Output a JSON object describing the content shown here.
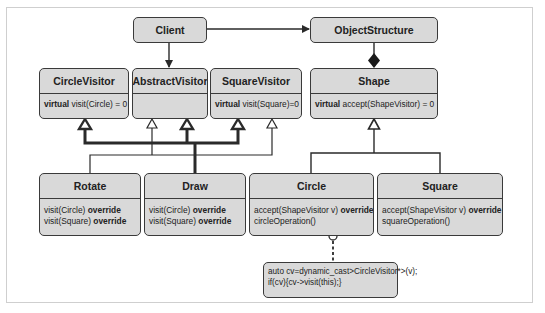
{
  "diagram": {
    "classes": {
      "client": {
        "name": "Client"
      },
      "object_structure": {
        "name": "ObjectStructure"
      },
      "circle_visitor": {
        "name": "CircleVisitor",
        "method_kw": "virtual",
        "method": " visit(Circle) = 0"
      },
      "abstract_visitor": {
        "name": "AbstractVisitor"
      },
      "square_visitor": {
        "name": "SquareVisitor",
        "method_kw": "virtual",
        "method": " visit(Square)=0"
      },
      "shape": {
        "name": "Shape",
        "method_kw": "virtual",
        "method": " accept(ShapeVisitor) = 0"
      },
      "rotate": {
        "name": "Rotate",
        "m1": "visit(Circle) ",
        "m1_kw": "override",
        "m2": "visit(Square) ",
        "m2_kw": "override"
      },
      "draw": {
        "name": "Draw",
        "m1": "visit(Circle) ",
        "m1_kw": "override",
        "m2": "visit(Square) ",
        "m2_kw": "override"
      },
      "circle": {
        "name": "Circle",
        "m1": "accept(ShapeVisitor v) ",
        "m1_kw": "override",
        "m2": "circleOperation()"
      },
      "square": {
        "name": "Square",
        "m1": "accept(ShapeVisitor v) ",
        "m1_kw": "override",
        "m2": "squareOperation()"
      }
    },
    "note": {
      "line1": "auto cv=dynamic_cast>CircleVisitor*>(v);",
      "line2": "if(cv){cv->visit(this);}"
    },
    "relations": [
      {
        "from": "Client",
        "to": "ObjectStructure",
        "type": "association"
      },
      {
        "from": "Client",
        "to": "AbstractVisitor",
        "type": "association"
      },
      {
        "from": "ObjectStructure",
        "to": "Shape",
        "type": "composition"
      },
      {
        "from": "Rotate",
        "to": "CircleVisitor",
        "type": "inheritance"
      },
      {
        "from": "Rotate",
        "to": "AbstractVisitor",
        "type": "inheritance"
      },
      {
        "from": "Rotate",
        "to": "SquareVisitor",
        "type": "inheritance"
      },
      {
        "from": "Draw",
        "to": "CircleVisitor",
        "type": "inheritance"
      },
      {
        "from": "Draw",
        "to": "AbstractVisitor",
        "type": "inheritance"
      },
      {
        "from": "Draw",
        "to": "SquareVisitor",
        "type": "inheritance"
      },
      {
        "from": "Circle",
        "to": "Shape",
        "type": "inheritance"
      },
      {
        "from": "Square",
        "to": "Shape",
        "type": "inheritance"
      },
      {
        "from": "Circle",
        "to": "note",
        "type": "note-link"
      }
    ],
    "colors": {
      "box_fill": "#d9d9d9",
      "stroke": "#3a3a3a"
    }
  }
}
